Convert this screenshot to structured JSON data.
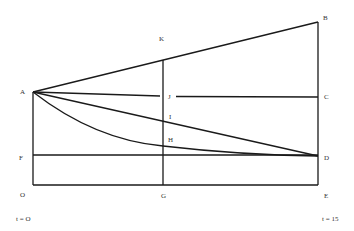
{
  "diagram": {
    "points": {
      "A": {
        "label": "A"
      },
      "B": {
        "label": "B"
      },
      "C": {
        "label": "C"
      },
      "D": {
        "label": "D"
      },
      "E": {
        "label": "E"
      },
      "F": {
        "label": "F"
      },
      "G": {
        "label": "G"
      },
      "H": {
        "label": "H"
      },
      "I": {
        "label": "I"
      },
      "J": {
        "label": "J"
      },
      "K": {
        "label": "K"
      },
      "O": {
        "label": "O"
      }
    },
    "time_labels": {
      "start": "t = O",
      "end": "t = 15"
    },
    "colors": {
      "line": "#1a1a1a",
      "text": "#333333",
      "background": "#ffffff"
    }
  }
}
